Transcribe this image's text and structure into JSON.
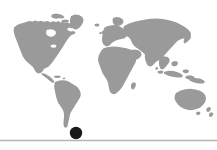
{
  "figure": {
    "name": "world-map-location-marker",
    "width": 217,
    "height": 150,
    "background_color": "#ffffff",
    "alt_text": "World map silhouette in grey with a black dot marking a location at the southern tip of South America"
  },
  "map": {
    "name": "world-map",
    "projection_style": "equirectangular-silhouette",
    "land_color": "#9a9a9a",
    "ocean_color": "#ffffff",
    "bounds": {
      "left": 13,
      "top": 12,
      "right": 207,
      "bottom": 131
    },
    "regions": [
      {
        "name": "north-america",
        "label": "North America"
      },
      {
        "name": "greenland",
        "label": "Greenland"
      },
      {
        "name": "south-america",
        "label": "South America"
      },
      {
        "name": "europe",
        "label": "Europe"
      },
      {
        "name": "africa",
        "label": "Africa"
      },
      {
        "name": "asia",
        "label": "Asia"
      },
      {
        "name": "southeast-asia-islands",
        "label": "Southeast Asia Islands"
      },
      {
        "name": "australia",
        "label": "Australia"
      },
      {
        "name": "new-zealand",
        "label": "New Zealand"
      },
      {
        "name": "japan",
        "label": "Japan"
      },
      {
        "name": "british-isles",
        "label": "British Isles"
      },
      {
        "name": "madagascar",
        "label": "Madagascar"
      }
    ]
  },
  "marker": {
    "name": "location-marker",
    "color": "#1a1a1a",
    "shape": "circle",
    "center_x": 76,
    "center_y": 133,
    "radius": 6.2,
    "region_label": "southern South America"
  },
  "baseline": {
    "name": "baseline-rule",
    "color": "#b4b4b4",
    "y": 140.5,
    "x_start": 0,
    "x_end": 217,
    "thickness": 1.6
  }
}
